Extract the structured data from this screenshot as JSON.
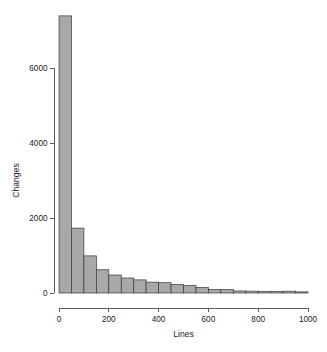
{
  "chart_data": {
    "type": "bar",
    "title": "",
    "subtitle": "",
    "xlabel": "Lines",
    "ylabel": "Changes",
    "grid": false,
    "legend": false,
    "legend_position": "none",
    "bin_width": 50,
    "xlim": [
      0,
      1000
    ],
    "ylim": [
      0,
      7400
    ],
    "xticks": [
      0,
      200,
      400,
      600,
      800,
      1000
    ],
    "xtick_labels": [
      "0",
      "200",
      "400",
      "600",
      "800",
      "1000"
    ],
    "yticks": [
      0,
      2000,
      4000,
      6000
    ],
    "ytick_labels": [
      "0",
      "2000",
      "4000",
      "6000"
    ],
    "bar_fill_color": "#a8a8a8",
    "bar_edge_color": "#3a3a3a",
    "axis_color": "#5d5d5d",
    "text_color": "#1a1a1a",
    "bin_edges": [
      0,
      50,
      100,
      150,
      200,
      250,
      300,
      350,
      400,
      450,
      500,
      550,
      600,
      650,
      700,
      750,
      800,
      850,
      900,
      950,
      1000
    ],
    "categories": [
      "0-50",
      "50-100",
      "100-150",
      "150-200",
      "200-250",
      "250-300",
      "300-350",
      "350-400",
      "400-450",
      "450-500",
      "500-550",
      "550-600",
      "600-650",
      "650-700",
      "700-750",
      "750-800",
      "800-850",
      "850-900",
      "900-950",
      "950-1000"
    ],
    "values": [
      7390,
      1730,
      990,
      620,
      480,
      400,
      350,
      290,
      275,
      225,
      200,
      150,
      95,
      90,
      55,
      50,
      45,
      42,
      48,
      30
    ]
  }
}
